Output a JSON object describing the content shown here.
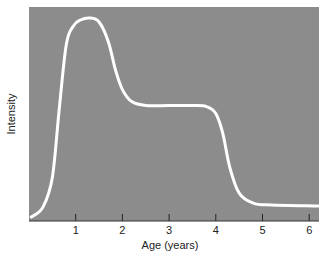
{
  "chart_data": {
    "type": "line",
    "title": "",
    "xlabel": "Age (years)",
    "ylabel": "Intensity",
    "xlim": [
      0,
      6.2
    ],
    "ylim": [
      0,
      1
    ],
    "x_ticks": [
      1,
      2,
      3,
      4,
      5,
      6
    ],
    "y_ticks": [],
    "grid": false,
    "legend": null,
    "background_color": "#8c8c8c",
    "line_color": "#ffffff",
    "series": [
      {
        "name": "Intensity",
        "x": [
          0.05,
          0.3,
          0.5,
          0.65,
          0.8,
          0.95,
          1.1,
          1.3,
          1.5,
          1.7,
          1.85,
          2.0,
          2.2,
          2.5,
          3.0,
          3.5,
          3.8,
          4.0,
          4.15,
          4.3,
          4.5,
          4.8,
          5.2,
          6.2
        ],
        "y": [
          0.0,
          0.05,
          0.2,
          0.55,
          0.87,
          0.96,
          0.99,
          1.0,
          0.98,
          0.88,
          0.74,
          0.64,
          0.58,
          0.56,
          0.56,
          0.56,
          0.555,
          0.52,
          0.42,
          0.25,
          0.12,
          0.07,
          0.06,
          0.055
        ]
      }
    ]
  }
}
